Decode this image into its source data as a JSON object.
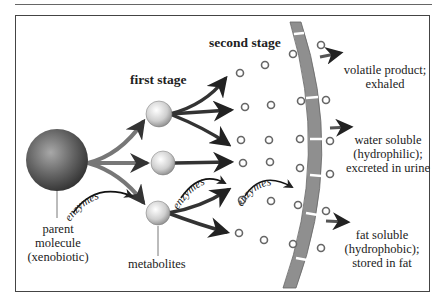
{
  "diagram": {
    "title_fragment": "ogy,",
    "stages": {
      "first": "first stage",
      "second": "second stage"
    },
    "labels": {
      "parent": [
        "parent",
        "molecule",
        "(xenobiotic)"
      ],
      "metabolites": "metabolites",
      "enzymes": "enzymes"
    },
    "outcomes": [
      {
        "lines": [
          "volatile product;",
          "exhaled"
        ]
      },
      {
        "lines": [
          "water soluble",
          "(hydrophilic);",
          "excreted in urine"
        ]
      },
      {
        "lines": [
          "fat soluble",
          "(hydrophobic);",
          "stored in fat"
        ]
      }
    ],
    "colors": {
      "membrane": "#8f8f8f",
      "parent_sphere": "#555555",
      "metabolite_sphere": "#d8d8d8",
      "arrow": "#444444",
      "frame": "#444444"
    }
  }
}
